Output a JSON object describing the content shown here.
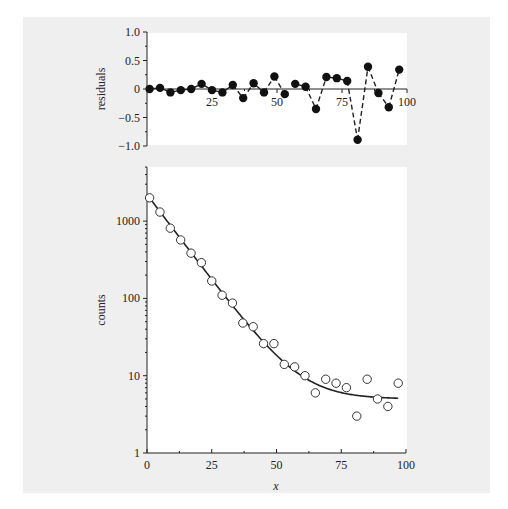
{
  "chart_data": [
    {
      "type": "scatter",
      "panel": "residuals",
      "title": "",
      "xlabel": "",
      "ylabel": "residuals",
      "xlim": [
        0,
        100
      ],
      "ylim": [
        -1.0,
        1.0
      ],
      "x_ticks": [
        25,
        50,
        75,
        100
      ],
      "x_tick_labels": [
        "25",
        "50",
        "75",
        "100"
      ],
      "y_ticks": [
        1.0,
        0.5,
        0,
        -0.5,
        -1.0
      ],
      "y_tick_labels": [
        "1.0",
        "0.5",
        "0",
        "−0.5",
        "−1.0"
      ],
      "grid": false,
      "marker": "filled-circle",
      "x": [
        1,
        5,
        9,
        13,
        17,
        21,
        25,
        29,
        33,
        37,
        41,
        45,
        49,
        53,
        57,
        61,
        65,
        69,
        73,
        77,
        81,
        85,
        89,
        93,
        97
      ],
      "y": [
        0.0,
        0.02,
        -0.06,
        -0.02,
        0.0,
        0.09,
        -0.02,
        -0.06,
        0.07,
        -0.16,
        0.1,
        -0.06,
        0.22,
        -0.09,
        0.09,
        0.04,
        -0.35,
        0.21,
        0.19,
        0.14,
        -0.89,
        0.39,
        -0.07,
        -0.32,
        0.34
      ],
      "segment_styles": [
        "solid",
        "solid",
        "solid",
        "solid",
        "solid",
        "solid",
        "solid",
        "solid",
        "dashed",
        "dashed",
        "solid",
        "dashed",
        "dashed",
        "none",
        "solid",
        "dashed",
        "dashed",
        "solid",
        "solid",
        "dashed",
        "dashed",
        "dashed",
        "dashed",
        "dashed"
      ]
    },
    {
      "type": "scatter",
      "panel": "counts",
      "title": "",
      "xlabel": "x",
      "ylabel": "counts",
      "xscale": "linear",
      "yscale": "log",
      "xlim": [
        0,
        100
      ],
      "ylim": [
        1,
        5000
      ],
      "x_ticks": [
        0,
        25,
        50,
        75,
        100
      ],
      "x_tick_labels": [
        "0",
        "25",
        "50",
        "75",
        "100"
      ],
      "y_ticks": [
        1,
        10,
        100,
        1000
      ],
      "y_tick_labels": [
        "1",
        "10",
        "100",
        "1000"
      ],
      "grid": false,
      "marker": "open-circle",
      "x": [
        1,
        5,
        9,
        13,
        17,
        21,
        25,
        29,
        33,
        37,
        41,
        45,
        49,
        53,
        57,
        61,
        65,
        69,
        73,
        77,
        81,
        85,
        89,
        93,
        97
      ],
      "y": [
        2000,
        1310,
        810,
        570,
        385,
        290,
        168,
        110,
        87,
        48,
        43,
        26,
        26,
        14,
        13,
        10,
        6,
        9,
        8,
        7,
        3,
        9,
        5,
        4,
        8
      ],
      "fit": {
        "name": "fit",
        "model": "A*exp(-x/tau)+C",
        "A": 2200,
        "tau": 9.8,
        "C": 5,
        "x_range": [
          0,
          97
        ]
      }
    }
  ]
}
